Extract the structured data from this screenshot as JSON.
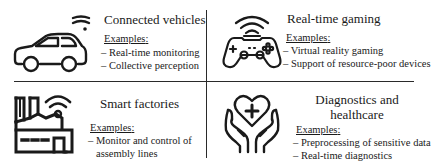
{
  "quadrants": [
    {
      "id": "connected-vehicles",
      "title": "Connected vehicles",
      "icon": "car-wifi-icon",
      "examples_label": "Examples",
      "examples": [
        "– Real-time monitoring",
        "– Collective perception"
      ]
    },
    {
      "id": "real-time-gaming",
      "title": "Real-time gaming",
      "icon": "gamepad-wifi-icon",
      "examples_label": "Examples",
      "examples": [
        "– Virtual reality gaming",
        "– Support of resource-poor devices"
      ]
    },
    {
      "id": "smart-factories",
      "title": "Smart factories",
      "icon": "factory-wifi-icon",
      "examples_label": "Examples",
      "examples": [
        "– Monitor and control of",
        "assembly lines"
      ]
    },
    {
      "id": "diagnostics-healthcare",
      "title_line1": "Diagnostics and",
      "title_line2": "healthcare",
      "icon": "heart-hands-icon",
      "examples_label": "Examples",
      "examples": [
        "– Preprocessing of sensitive data",
        "– Real-time diagnostics"
      ]
    }
  ],
  "colors": {
    "stroke": "#1a1a1a",
    "background": "#ffffff"
  }
}
